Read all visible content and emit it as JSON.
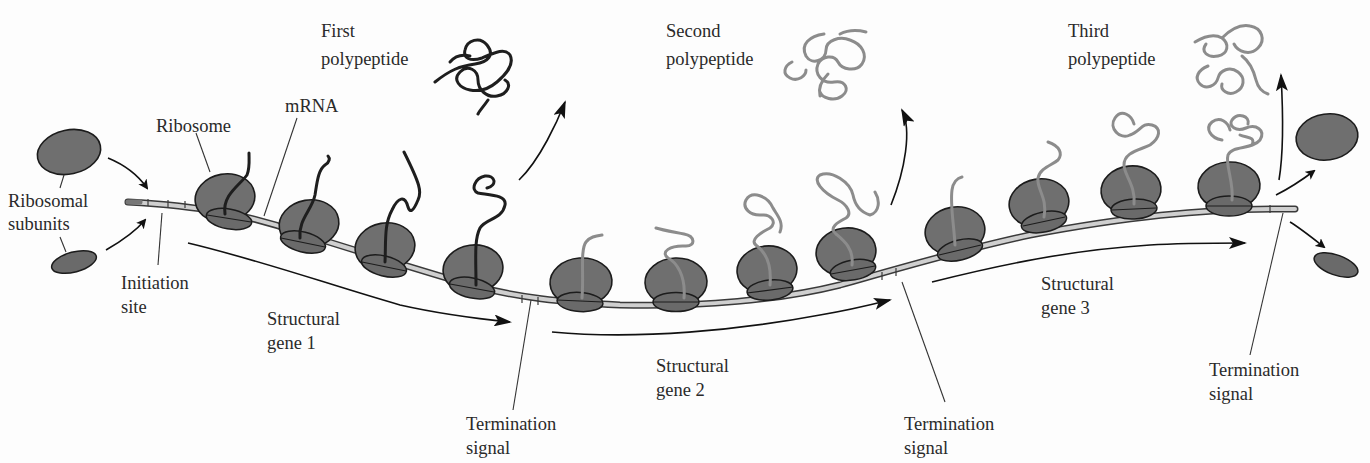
{
  "figure": {
    "type": "polycistronic mRNA translation diagram",
    "labels": {
      "ribosomal_subunits_line1": "Ribosomal",
      "ribosomal_subunits_line2": "subunits",
      "ribosome": "Ribosome",
      "mrna": "mRNA",
      "initiation_site_line1": "Initiation",
      "initiation_site_line2": "site",
      "first_polypeptide_line1": "First",
      "first_polypeptide_line2": "polypeptide",
      "second_polypeptide_line1": "Second",
      "second_polypeptide_line2": "polypeptide",
      "third_polypeptide_line1": "Third",
      "third_polypeptide_line2": "polypeptide",
      "gene1_line1": "Structural",
      "gene1_line2": "gene 1",
      "gene2_line1": "Structural",
      "gene2_line2": "gene 2",
      "gene3_line1": "Structural",
      "gene3_line2": "gene 3",
      "termination1_line1": "Termination",
      "termination1_line2": "signal",
      "termination2_line1": "Termination",
      "termination2_line2": "signal",
      "termination3_line1": "Termination",
      "termination3_line2": "signal"
    },
    "genes": [
      {
        "name": "Structural gene 1",
        "ribosome_count": 4,
        "chain_color": "#1e1e1e"
      },
      {
        "name": "Structural gene 2",
        "ribosome_count": 4,
        "chain_color": "#8c8c8c"
      },
      {
        "name": "Structural gene 3",
        "ribosome_count": 4,
        "chain_color": "#8c8c8c"
      }
    ],
    "colors": {
      "background": "#fdfdfd",
      "ribosome_fill": "#6f6f6f",
      "outline": "#1c1c1c",
      "mrna_fill": "#cfcfcf",
      "first_polypeptide": "#1e1e1e",
      "later_polypeptides": "#8c8c8c"
    }
  }
}
